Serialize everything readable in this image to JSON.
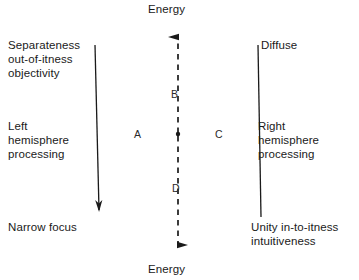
{
  "figure": {
    "kind": "axis-cross-diagram",
    "width": 359,
    "height": 280,
    "background_color": "#ffffff",
    "line_color": "#1a1a1a",
    "text_color": "#1a1a1a"
  },
  "axis": {
    "top_label": "Energy",
    "bottom_label": "Energy",
    "style": "dashed",
    "x_position": 178,
    "top_arrow": "up-arrow-icon",
    "bottom_arrow": "down-arrow-icon"
  },
  "quadrant_labels": {
    "a": "A",
    "b": "B",
    "c": "C",
    "d": "D"
  },
  "corner_labels": {
    "top_left": "Separateness\nout-of-itness\nobjectivity",
    "top_right": "Diffuse",
    "bottom_left": "Narrow focus",
    "bottom_right": "Unity in-to-itness\nintuitiveness"
  },
  "side_labels": {
    "left": "Left\nhemisphere\nprocessing",
    "right": "Right\nhemisphere\nprocessing"
  },
  "diagonals": [
    {
      "name": "separateness-to-narrow-focus",
      "from": [
        95,
        45
      ],
      "to": [
        91,
        216
      ],
      "through": [
        178,
        134
      ],
      "arrow_at": "end",
      "start_label": "Separateness out-of-itness objectivity",
      "end_label": "Narrow focus"
    },
    {
      "name": "diffuse-to-unity",
      "from": [
        258,
        45
      ],
      "to": [
        261,
        217
      ],
      "through": [
        178,
        134
      ],
      "arrow_at": "none",
      "start_label": "Diffuse",
      "end_label": "Unity in-to-itness intuitiveness"
    }
  ],
  "intersection": {
    "x": 178,
    "y": 134,
    "marker": "dot"
  }
}
